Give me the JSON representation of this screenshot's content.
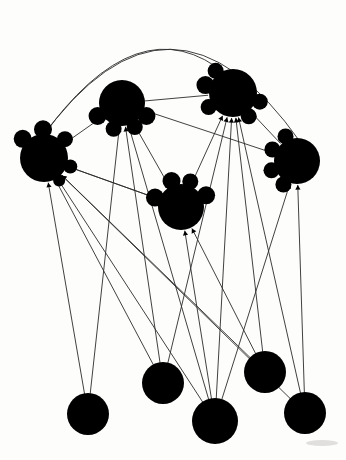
{
  "figure": {
    "background_color": "#fdfdfc",
    "node_color": "#000000",
    "edge_color": "#2b2b2b",
    "width": 346,
    "height": 460
  },
  "chart_data": {
    "type": "diagram",
    "node_count": 10,
    "edge_count": 26,
    "hub_node_count": 5,
    "leaf_node_count": 5,
    "nodes": [
      {
        "id": "hub-left",
        "label": "hub-left",
        "kind": "hub",
        "cx": 44,
        "cy": 158,
        "r": 24,
        "lobes": [
          {
            "a": 222,
            "r": 9
          },
          {
            "a": 268,
            "r": 9
          },
          {
            "a": 318,
            "r": 8
          },
          {
            "a": 18,
            "r": 7
          },
          {
            "a": 56,
            "r": 6
          }
        ]
      },
      {
        "id": "hub-top-left",
        "label": "hub-top-left",
        "kind": "hub",
        "cx": 122,
        "cy": 103,
        "r": 23,
        "lobes": [
          {
            "a": 152,
            "r": 9
          },
          {
            "a": 108,
            "r": 8
          },
          {
            "a": 28,
            "r": 9
          },
          {
            "a": 62,
            "r": 8
          }
        ]
      },
      {
        "id": "hub-top-right",
        "label": "hub-top-right",
        "kind": "hub",
        "cx": 233,
        "cy": 93,
        "r": 24,
        "lobes": [
          {
            "a": 196,
            "r": 9
          },
          {
            "a": 232,
            "r": 8
          },
          {
            "a": 150,
            "r": 8
          },
          {
            "a": 18,
            "r": 8
          },
          {
            "a": 56,
            "r": 8
          }
        ]
      },
      {
        "id": "hub-right",
        "label": "hub-right",
        "kind": "hub",
        "cx": 297,
        "cy": 161,
        "r": 23,
        "lobes": [
          {
            "a": 205,
            "r": 8
          },
          {
            "a": 160,
            "r": 8
          },
          {
            "a": 245,
            "r": 8
          },
          {
            "a": 120,
            "r": 8
          }
        ]
      },
      {
        "id": "hub-center",
        "label": "hub-center",
        "kind": "hub",
        "cx": 181,
        "cy": 207,
        "r": 23,
        "lobes": [
          {
            "a": 200,
            "r": 9
          },
          {
            "a": 250,
            "r": 9
          },
          {
            "a": 290,
            "r": 8
          },
          {
            "a": 335,
            "r": 9
          }
        ]
      },
      {
        "id": "leaf-1",
        "label": "leaf-1",
        "kind": "leaf",
        "cx": 88,
        "cy": 414,
        "r": 21,
        "lobes": []
      },
      {
        "id": "leaf-2",
        "label": "leaf-2",
        "kind": "leaf",
        "cx": 163,
        "cy": 383,
        "r": 21,
        "lobes": []
      },
      {
        "id": "leaf-3",
        "label": "leaf-3",
        "kind": "leaf",
        "cx": 215,
        "cy": 421,
        "r": 23,
        "lobes": []
      },
      {
        "id": "leaf-4",
        "label": "leaf-4",
        "kind": "leaf",
        "cx": 265,
        "cy": 372,
        "r": 21,
        "lobes": []
      },
      {
        "id": "leaf-5",
        "label": "leaf-5",
        "kind": "leaf",
        "cx": 305,
        "cy": 413,
        "r": 21,
        "lobes": []
      }
    ],
    "edges": [
      {
        "from": "leaf-1",
        "to": "hub-top-left",
        "style": "straight",
        "arrow": true
      },
      {
        "from": "leaf-1",
        "to": "hub-left",
        "style": "straight",
        "arrow": true
      },
      {
        "from": "leaf-2",
        "to": "hub-left",
        "style": "straight",
        "arrow": true
      },
      {
        "from": "leaf-2",
        "to": "hub-top-left",
        "style": "straight",
        "arrow": true
      },
      {
        "from": "leaf-2",
        "to": "hub-top-right",
        "style": "straight",
        "arrow": true
      },
      {
        "from": "leaf-3",
        "to": "hub-left",
        "style": "straight",
        "arrow": true
      },
      {
        "from": "leaf-3",
        "to": "hub-top-left",
        "style": "straight",
        "arrow": true
      },
      {
        "from": "leaf-3",
        "to": "hub-center",
        "style": "straight",
        "arrow": true
      },
      {
        "from": "leaf-3",
        "to": "hub-top-right",
        "style": "straight",
        "arrow": true
      },
      {
        "from": "leaf-3",
        "to": "hub-right",
        "style": "straight",
        "arrow": true
      },
      {
        "from": "leaf-4",
        "to": "hub-left",
        "style": "straight",
        "arrow": true
      },
      {
        "from": "leaf-4",
        "to": "hub-top-right",
        "style": "straight",
        "arrow": true
      },
      {
        "from": "leaf-4",
        "to": "hub-center",
        "style": "straight",
        "arrow": true
      },
      {
        "from": "leaf-5",
        "to": "hub-left",
        "style": "straight",
        "arrow": true
      },
      {
        "from": "leaf-5",
        "to": "hub-top-right",
        "style": "straight",
        "arrow": true
      },
      {
        "from": "leaf-5",
        "to": "hub-right",
        "style": "straight",
        "arrow": true
      },
      {
        "from": "hub-center",
        "to": "hub-top-left",
        "style": "straight",
        "arrow": true
      },
      {
        "from": "hub-center",
        "to": "hub-top-right",
        "style": "straight",
        "arrow": true
      },
      {
        "from": "hub-center",
        "to": "hub-left",
        "style": "straight",
        "arrow": true
      },
      {
        "from": "hub-top-left",
        "to": "hub-top-right",
        "style": "straight",
        "arrow": false
      },
      {
        "from": "hub-top-left",
        "to": "hub-left",
        "style": "straight",
        "arrow": false
      },
      {
        "from": "hub-top-left",
        "to": "hub-right",
        "style": "straight",
        "arrow": false
      },
      {
        "from": "hub-top-right",
        "to": "hub-right",
        "style": "straight",
        "arrow": false
      },
      {
        "from": "hub-left",
        "to": "hub-center",
        "style": "straight",
        "arrow": false
      },
      {
        "from": "hub-left",
        "to": "hub-right",
        "style": "arc-outer",
        "arrow": false
      },
      {
        "from": "hub-left",
        "to": "hub-top-right",
        "style": "arc-inner",
        "arrow": false
      }
    ]
  }
}
